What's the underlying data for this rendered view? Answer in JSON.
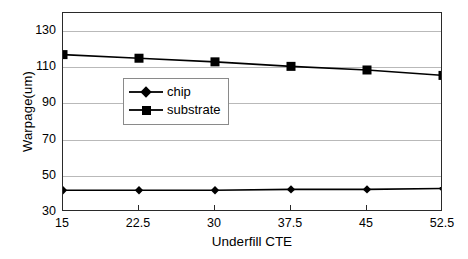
{
  "chart_data": {
    "type": "line",
    "title": "",
    "xlabel": "Underfill CTE",
    "ylabel": "Warpage(um)",
    "categories": [
      "15",
      "22.5",
      "30",
      "37.5",
      "45",
      "52.5"
    ],
    "x": [
      15,
      22.5,
      30,
      37.5,
      45,
      52.5
    ],
    "ylim": [
      30,
      140
    ],
    "yticks": [
      30,
      50,
      70,
      90,
      110,
      130
    ],
    "ytick_labels": [
      "30",
      "50",
      "70",
      "90",
      "110",
      "130"
    ],
    "grid": "horizontal",
    "legend_position": "center",
    "series": [
      {
        "name": "chip",
        "marker": "diamond",
        "color": "#000000",
        "values": [
          42,
          42,
          42,
          42.5,
          42.5,
          43
        ]
      },
      {
        "name": "substrate",
        "marker": "square",
        "color": "#000000",
        "values": [
          117,
          115,
          113,
          110.5,
          108.5,
          105.5
        ]
      }
    ]
  },
  "legend": {
    "items": [
      {
        "label": "chip",
        "marker": "diamond"
      },
      {
        "label": "substrate",
        "marker": "square"
      }
    ]
  }
}
